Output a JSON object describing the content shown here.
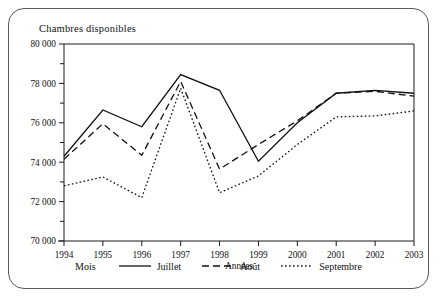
{
  "figure": {
    "title": "Chambres disponibles",
    "legend_title": "Mois"
  },
  "chart_data": {
    "type": "line",
    "title": "Chambres disponibles",
    "xlabel": "Années",
    "ylabel": "",
    "categories": [
      "1994",
      "1995",
      "1996",
      "1997",
      "1998",
      "1999",
      "2000",
      "2001",
      "2002",
      "2003"
    ],
    "x": [
      1994,
      1995,
      1996,
      1997,
      1998,
      1999,
      2000,
      2001,
      2002,
      2003
    ],
    "xlim": [
      1994,
      2003
    ],
    "ylim": [
      70000,
      80000
    ],
    "yticks": [
      70000,
      72000,
      74000,
      76000,
      78000,
      80000
    ],
    "yticklabels": [
      "70 000",
      "72 000",
      "74 000",
      "76 000",
      "78 000",
      "80 000"
    ],
    "grid": false,
    "legend_position": "bottom",
    "series": [
      {
        "name": "Juillet",
        "style": "solid",
        "values": [
          74300,
          76650,
          75800,
          78450,
          77650,
          74050,
          76000,
          77500,
          77650,
          77500
        ]
      },
      {
        "name": "Août",
        "style": "dashed",
        "values": [
          74150,
          75950,
          74350,
          78100,
          73650,
          74900,
          76100,
          77500,
          77600,
          77350
        ]
      },
      {
        "name": "Septembre",
        "style": "dotted",
        "values": [
          72800,
          73250,
          72200,
          77750,
          72450,
          73300,
          74900,
          76300,
          76350,
          76600
        ]
      }
    ]
  }
}
